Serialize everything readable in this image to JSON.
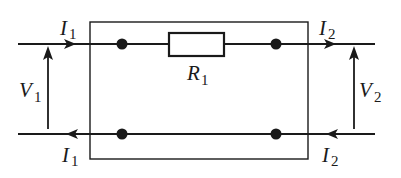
{
  "diagram": {
    "type": "two-port network",
    "colors": {
      "ink": "#1a1a1a",
      "background": "#ffffff"
    },
    "labels": {
      "i1_top": {
        "main": "I",
        "sub": "1"
      },
      "i2_top": {
        "main": "I",
        "sub": "2"
      },
      "i1_bottom": {
        "main": "I",
        "sub": "1"
      },
      "i2_bottom": {
        "main": "I",
        "sub": "2"
      },
      "v1": {
        "main": "V",
        "sub": "1"
      },
      "v2": {
        "main": "V",
        "sub": "2"
      },
      "r1": {
        "main": "R",
        "sub": "1"
      }
    },
    "components": [
      {
        "id": "box",
        "kind": "two-port-boundary"
      },
      {
        "id": "resistor",
        "kind": "resistor",
        "label": "R1"
      },
      {
        "id": "node-top-left",
        "kind": "junction-dot"
      },
      {
        "id": "node-top-right",
        "kind": "junction-dot"
      },
      {
        "id": "node-bottom-left",
        "kind": "junction-dot"
      },
      {
        "id": "node-bottom-right",
        "kind": "junction-dot"
      }
    ],
    "arrows": [
      {
        "id": "i1-in",
        "direction": "right",
        "label": "I1"
      },
      {
        "id": "i2-out",
        "direction": "right",
        "label": "I2"
      },
      {
        "id": "i1-return",
        "direction": "left",
        "label": "I1"
      },
      {
        "id": "i2-return",
        "direction": "left",
        "label": "I2"
      },
      {
        "id": "v1",
        "direction": "up",
        "label": "V1"
      },
      {
        "id": "v2",
        "direction": "up",
        "label": "V2"
      }
    ]
  }
}
